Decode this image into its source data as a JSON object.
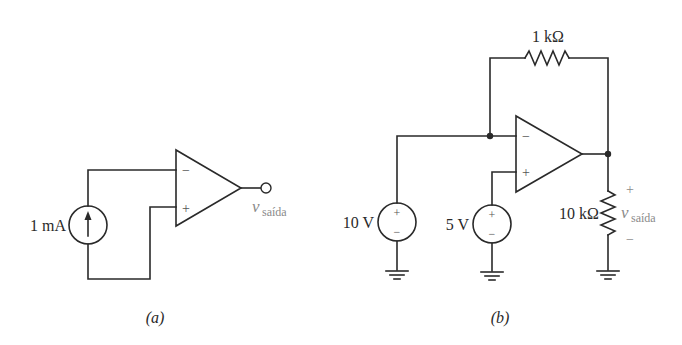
{
  "figure": {
    "panels": [
      {
        "id": "a",
        "caption": "(a)",
        "source": {
          "type": "current-source",
          "label": "1 mA",
          "arrow": "up"
        },
        "opamp": {
          "minus_label": "−",
          "plus_label": "+"
        },
        "output": {
          "label_main": "v",
          "label_sub": "saída"
        }
      },
      {
        "id": "b",
        "caption": "(b)",
        "feedback_resistor": {
          "label": "1 kΩ"
        },
        "source_1": {
          "type": "voltage-source",
          "label": "10 V",
          "plus": "+",
          "minus": "−"
        },
        "source_2": {
          "type": "voltage-source",
          "label": "5 V",
          "plus": "+",
          "minus": "−"
        },
        "load_resistor": {
          "label": "10 kΩ"
        },
        "opamp": {
          "minus_label": "−",
          "plus_label": "+"
        },
        "output": {
          "label_main": "v",
          "label_sub": "saída",
          "plus": "+",
          "minus": "−"
        }
      }
    ]
  }
}
